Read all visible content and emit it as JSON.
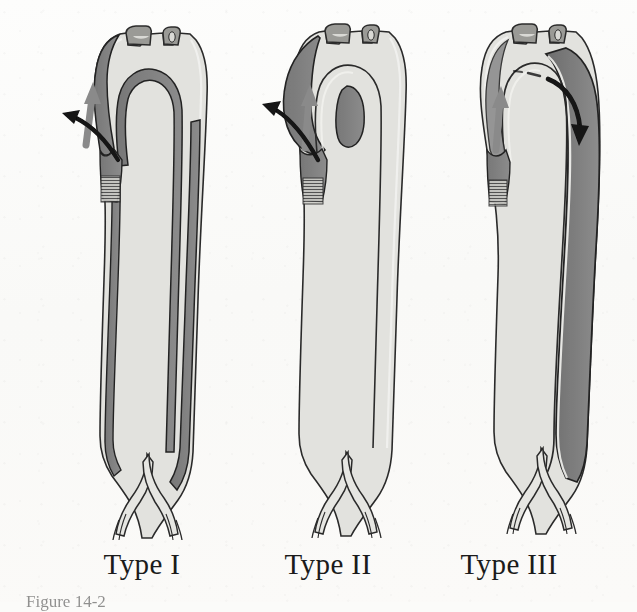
{
  "figure": {
    "kind": "medical-illustration",
    "background_color": "#fbfbf9",
    "ink_color": "#1b1b1b",
    "true_lumen_color": "#e2e2de",
    "false_lumen_color": "#7d7d7d",
    "false_lumen_dark_color": "#6a6a6a",
    "gray_arrow_color": "#8a8a8a",
    "black_arrow_color": "#111111"
  },
  "panels": [
    {
      "id": "type-1",
      "label": "Type I",
      "dissection_extent": "ascending aorta through arch and entire descending aorta to bifurcation",
      "has_ascending_false_lumen": true,
      "has_descending_false_lumen": true,
      "arrows": [
        "gray-flow-arrow-ascending",
        "black-entry-tear-arrow"
      ]
    },
    {
      "id": "type-2",
      "label": "Type II",
      "dissection_extent": "confined to the ascending aorta",
      "has_ascending_false_lumen": true,
      "has_descending_false_lumen": false,
      "arrows": [
        "gray-flow-arrow-ascending",
        "black-entry-tear-arrow"
      ]
    },
    {
      "id": "type-3",
      "label": "Type III",
      "dissection_extent": "begins distal to the left subclavian artery and extends down the descending aorta",
      "has_ascending_false_lumen": false,
      "has_descending_false_lumen": true,
      "arrows": [
        "gray-flow-arrow-ascending",
        "black-descending-flow-arrow"
      ]
    }
  ],
  "anatomy": {
    "arch_branches": 3,
    "arch_branch_names": [
      "brachiocephalic-trunk",
      "left-common-carotid-artery",
      "left-subclavian-artery"
    ],
    "bifurcation": "aortoiliac bifurcation with common iliac arteries"
  },
  "caption": {
    "text": "Figure 14-2",
    "clipped": true
  }
}
